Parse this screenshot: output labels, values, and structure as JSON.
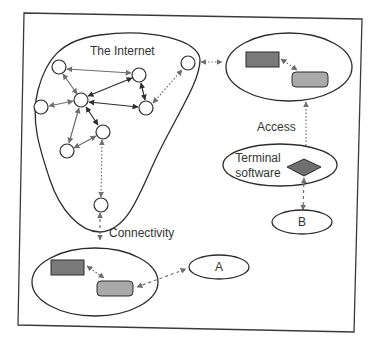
{
  "diagram": {
    "internet_label": "The Internet",
    "connectivity_label": "Connectivity",
    "access_label": "Access",
    "terminal_label_line1": "Terminal",
    "terminal_label_line2": "software",
    "node_a_label": "A",
    "node_b_label": "B"
  },
  "colors": {
    "stroke": "#2b2b2b",
    "arrow_gray": "#6e6e6e",
    "arrow_dark": "#2e2e2e",
    "box_dark": "#7a7a7a",
    "box_light": "#a9a9a9",
    "diamond": "#6f6f6f",
    "background": "#ffffff"
  }
}
